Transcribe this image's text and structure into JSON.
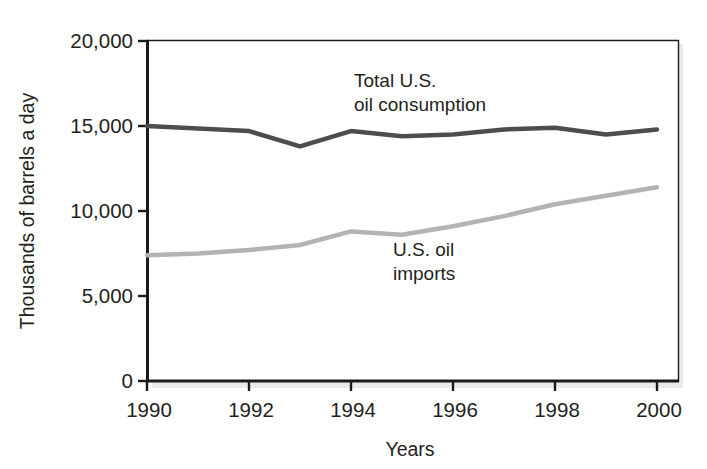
{
  "chart_data": {
    "type": "line",
    "title": "",
    "xlabel": "Years",
    "ylabel": "Thousands of barrels a day",
    "xlim": [
      1990,
      2000
    ],
    "ylim": [
      0,
      20000
    ],
    "grid": false,
    "legend_position": "inline-annotation",
    "x": [
      1990,
      1991,
      1992,
      1993,
      1994,
      1995,
      1996,
      1997,
      1998,
      1999,
      2000
    ],
    "xticks": [
      "1990",
      "1992",
      "1994",
      "1996",
      "1998",
      "2000"
    ],
    "xtick_values": [
      1990,
      1992,
      1994,
      1996,
      1998,
      2000
    ],
    "yticks": [
      "0",
      "5,000",
      "10,000",
      "15,000",
      "20,000"
    ],
    "ytick_values": [
      0,
      5000,
      10000,
      15000,
      20000
    ],
    "series": [
      {
        "name": "Total U.S. oil consumption",
        "color": "#4d4d4d",
        "values": [
          15000,
          14850,
          14700,
          13800,
          14700,
          14400,
          14500,
          14800,
          14900,
          14500,
          14800
        ]
      },
      {
        "name": "U.S. oil imports",
        "color": "#b3b3b3",
        "values": [
          7400,
          7500,
          7700,
          8000,
          8800,
          8600,
          9100,
          9700,
          10400,
          10900,
          11400
        ]
      }
    ],
    "annotations": [
      {
        "name": "consumption-label",
        "line1": "Total U.S.",
        "line2": "oil consumption",
        "x": 1996.2,
        "y": 18400
      },
      {
        "name": "imports-label",
        "line1": "U.S. oil",
        "line2": "imports",
        "x": 1994.6,
        "y": 7900
      }
    ]
  },
  "axis": {
    "ylabel": "Thousands of barrels a day",
    "xlabel": "Years",
    "ytick_labels": [
      "20,000",
      "15,000",
      "10,000",
      "5,000",
      "0"
    ],
    "xtick_labels": [
      "1990",
      "1992",
      "1994",
      "1996",
      "1998",
      "2000"
    ]
  },
  "annotations": {
    "consumption_line1": "Total U.S.",
    "consumption_line2": "oil consumption",
    "imports_line1": "U.S. oil",
    "imports_line2": "imports"
  },
  "colors": {
    "consumption": "#4d4d4d",
    "imports": "#b3b3b3",
    "axis": "#1a1a1a",
    "text": "#231f20",
    "background": "#ffffff"
  }
}
